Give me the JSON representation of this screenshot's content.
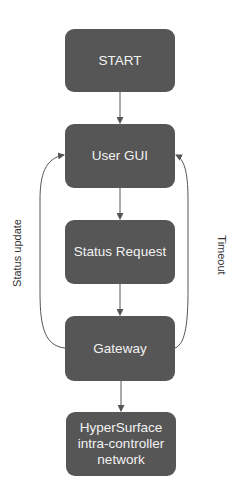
{
  "diagram": {
    "type": "flowchart",
    "colors": {
      "node_fill": "#565656",
      "node_text": "#f2f2f2",
      "edge": "#555555",
      "label_text": "#333333",
      "background": "#ffffff"
    },
    "nodes": [
      {
        "id": "start",
        "label": "START"
      },
      {
        "id": "user_gui",
        "label": "User GUI"
      },
      {
        "id": "status_request",
        "label": "Status Request"
      },
      {
        "id": "gateway",
        "label": "Gateway"
      },
      {
        "id": "hypersurface",
        "label": "HyperSurface\nintra-controller\nnetwork"
      }
    ],
    "edges": [
      {
        "from": "start",
        "to": "user_gui",
        "label": ""
      },
      {
        "from": "user_gui",
        "to": "status_request",
        "label": ""
      },
      {
        "from": "status_request",
        "to": "gateway",
        "label": ""
      },
      {
        "from": "gateway",
        "to": "hypersurface",
        "label": ""
      },
      {
        "from": "gateway",
        "to": "user_gui",
        "label": "Status update",
        "side": "left"
      },
      {
        "from": "gateway",
        "to": "user_gui",
        "label": "Timeout",
        "side": "right"
      }
    ],
    "side_labels": {
      "left": "Status update",
      "right": "Timeout"
    }
  }
}
